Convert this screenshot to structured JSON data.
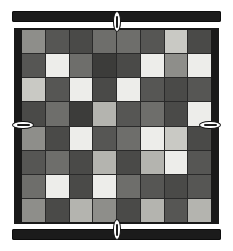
{
  "scene": {
    "title": "Grid Board",
    "background_color": "#ffffff",
    "frame_color": "#191919",
    "gridline_color": "#2a2a2a",
    "bar_color": "#1b1b1b",
    "clip_color": "#fdfdfd"
  },
  "bars": [
    {
      "name": "top-clamp-bar",
      "label": "Top clamp bar"
    },
    {
      "name": "bottom-clamp-bar",
      "label": "Bottom clamp bar"
    }
  ],
  "clips": [
    {
      "name": "clip-top",
      "label": "Top clip",
      "orientation": "vertical"
    },
    {
      "name": "clip-bottom",
      "label": "Bottom clip",
      "orientation": "vertical"
    },
    {
      "name": "clip-left",
      "label": "Left clip",
      "orientation": "horizontal"
    },
    {
      "name": "clip-right",
      "label": "Right clip",
      "orientation": "horizontal"
    }
  ],
  "chart_data": {
    "type": "heatmap",
    "title": "",
    "xlabel": "",
    "ylabel": "",
    "rows": 8,
    "cols": 8,
    "grid": true,
    "legend": "none",
    "palette": {
      "white": "#ededea",
      "light": "#c9c9c4",
      "lightmed": "#b4b4af",
      "medium": "#8e8e8a",
      "mediumdark": "#6e6e6b",
      "dark": "#565654",
      "darker": "#4a4a48",
      "darkest": "#3c3c3a"
    },
    "values": [
      [
        "medium",
        "dark",
        "darker",
        "mediumdark",
        "mediumdark",
        "dark",
        "light",
        "darker"
      ],
      [
        "dark",
        "white",
        "mediumdark",
        "darkest",
        "darker",
        "white",
        "medium",
        "white"
      ],
      [
        "light",
        "dark",
        "white",
        "darker",
        "white",
        "dark",
        "darker",
        "dark"
      ],
      [
        "darker",
        "mediumdark",
        "darkest",
        "lightmed",
        "dark",
        "mediumdark",
        "darker",
        "white"
      ],
      [
        "medium",
        "darker",
        "white",
        "dark",
        "mediumdark",
        "white",
        "light",
        "darker"
      ],
      [
        "dark",
        "mediumdark",
        "darker",
        "lightmed",
        "darker",
        "lightmed",
        "white",
        "dark"
      ],
      [
        "mediumdark",
        "white",
        "darker",
        "white",
        "mediumdark",
        "dark",
        "darker",
        "dark"
      ],
      [
        "medium",
        "darker",
        "lightmed",
        "medium",
        "darker",
        "lightmed",
        "dark",
        "lightmed"
      ]
    ]
  }
}
